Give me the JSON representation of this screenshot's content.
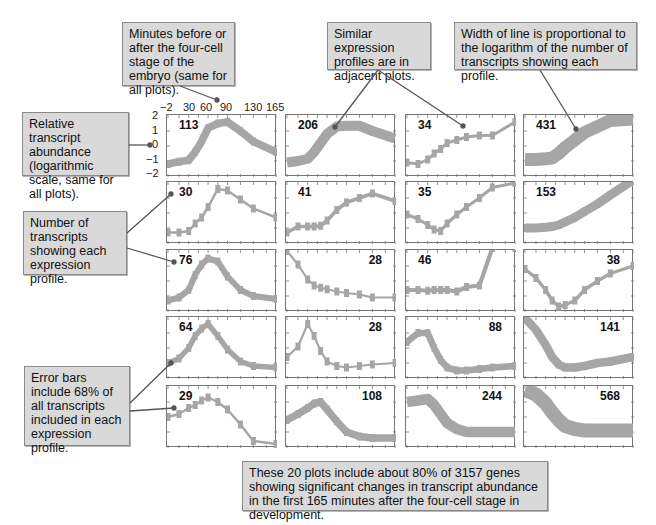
{
  "callouts": {
    "time_axis": "Minutes before or after the four-cell stage of the embryo (same for all plots).",
    "adjacent": "Similar expression profiles are in adjacent plots.",
    "line_width": "Width of line is proportional to the logarithm of the number of transcripts showing each profile.",
    "y_axis": "Relative transcript abundance (logarithmic scale, same for all plots).",
    "count": "Number of transcripts showing each expression profile.",
    "error_bars": "Error bars include 68% of all transcripts included in each expression profile.",
    "summary": "These 20 plots include about 80% of 3157 genes showing significant changes in transcript abundance in the first 165 minutes after the four-cell stage in development."
  },
  "axes": {
    "x_ticks": [
      "−2",
      "30",
      "60",
      "90",
      "130",
      "165"
    ],
    "y_ticks": [
      "2",
      "1",
      "0",
      "−1",
      "−2"
    ]
  },
  "colors": {
    "line": "#a6a6a6",
    "callout_bg": "#d9d9d9",
    "leader": "#555555"
  },
  "chart_data": {
    "type": "line",
    "xlabel": "Minutes before or after the four-cell stage of the embryo",
    "ylabel": "Relative transcript abundance (logarithmic scale)",
    "x": [
      -2,
      15,
      30,
      40,
      50,
      60,
      75,
      90,
      110,
      130,
      165
    ],
    "x_tick_labels": [
      "-2",
      "30",
      "60",
      "90",
      "130",
      "165"
    ],
    "xlim": [
      -2,
      165
    ],
    "ylim": [
      -2,
      2
    ],
    "grid": false,
    "panels": [
      {
        "row": 1,
        "col": 1,
        "count": 113,
        "values": [
          -1.2,
          -1.05,
          -0.95,
          -0.4,
          0.3,
          1.2,
          1.5,
          1.6,
          1.0,
          0.3,
          -0.4
        ]
      },
      {
        "row": 1,
        "col": 2,
        "count": 206,
        "values": [
          -1.1,
          -1.0,
          -0.85,
          -0.4,
          0.2,
          0.8,
          1.3,
          1.35,
          1.35,
          1.0,
          0.5
        ]
      },
      {
        "row": 1,
        "col": 3,
        "count": 34,
        "values": [
          -1.1,
          -1.2,
          -0.9,
          -0.5,
          -0.2,
          0.2,
          0.4,
          0.6,
          0.7,
          0.7,
          1.6
        ]
      },
      {
        "row": 1,
        "col": 4,
        "count": 431,
        "values": [
          -0.9,
          -0.9,
          -0.85,
          -0.8,
          -0.5,
          -0.1,
          0.4,
          0.9,
          1.3,
          1.7,
          1.8
        ]
      },
      {
        "row": 2,
        "col": 1,
        "count": 30,
        "values": [
          -1.3,
          -1.3,
          -1.2,
          -0.7,
          -0.3,
          0.4,
          1.6,
          1.5,
          0.9,
          0.3,
          -0.3
        ]
      },
      {
        "row": 2,
        "col": 2,
        "count": 41,
        "values": [
          -1.3,
          -0.9,
          -0.9,
          -0.9,
          -0.85,
          -0.5,
          0.2,
          0.7,
          1.0,
          1.3,
          0.8
        ]
      },
      {
        "row": 2,
        "col": 3,
        "count": 35,
        "values": [
          -0.1,
          -0.4,
          -0.8,
          -1.1,
          -1.2,
          -0.7,
          -0.1,
          0.4,
          1.0,
          1.7,
          2.0
        ]
      },
      {
        "row": 2,
        "col": 4,
        "count": 153,
        "values": [
          -1.0,
          -1.0,
          -0.95,
          -0.9,
          -0.8,
          -0.6,
          -0.3,
          0.1,
          0.6,
          1.2,
          2.2
        ]
      },
      {
        "row": 3,
        "col": 1,
        "count": 76,
        "values": [
          -1.3,
          -1.1,
          -0.6,
          0.4,
          1.1,
          1.5,
          1.3,
          0.3,
          -0.6,
          -1.0,
          -1.2
        ]
      },
      {
        "row": 3,
        "col": 2,
        "count": 28,
        "values": [
          2.0,
          1.1,
          0.1,
          -0.3,
          -0.45,
          -0.55,
          -0.7,
          -0.8,
          -0.9,
          -1.1,
          -1.1
        ]
      },
      {
        "row": 3,
        "col": 3,
        "count": 46,
        "values": [
          -0.6,
          -0.6,
          -0.65,
          -0.6,
          -0.6,
          -0.6,
          -0.7,
          -0.4,
          -0.3,
          2.2,
          2.2
        ]
      },
      {
        "row": 3,
        "col": 4,
        "count": 38,
        "values": [
          0.8,
          0.2,
          -0.6,
          -1.3,
          -1.7,
          -1.6,
          -1.3,
          -0.6,
          0.0,
          0.5,
          1.0
        ]
      },
      {
        "row": 4,
        "col": 1,
        "count": 64,
        "values": [
          -1.0,
          -0.7,
          0.0,
          0.8,
          1.3,
          1.6,
          0.8,
          -0.1,
          -0.9,
          -1.2,
          -1.3
        ]
      },
      {
        "row": 4,
        "col": 2,
        "count": 28,
        "values": [
          -0.6,
          0.1,
          1.6,
          0.8,
          -0.2,
          -0.9,
          -1.2,
          -1.3,
          -1.2,
          -1.1,
          -1.0
        ]
      },
      {
        "row": 4,
        "col": 3,
        "count": 88,
        "values": [
          0.4,
          1.0,
          1.0,
          0.0,
          -0.8,
          -1.3,
          -1.5,
          -1.5,
          -1.4,
          -1.3,
          -1.2
        ]
      },
      {
        "row": 4,
        "col": 4,
        "count": 141,
        "values": [
          2.0,
          1.2,
          0.2,
          -0.6,
          -1.1,
          -1.3,
          -1.3,
          -1.2,
          -1.0,
          -0.9,
          -0.6
        ]
      },
      {
        "row": 5,
        "col": 1,
        "count": 29,
        "values": [
          0.0,
          0.2,
          0.6,
          0.8,
          1.1,
          1.3,
          1.0,
          0.5,
          -0.5,
          -1.6,
          -1.8
        ]
      },
      {
        "row": 5,
        "col": 2,
        "count": 108,
        "values": [
          -0.2,
          0.2,
          0.6,
          0.9,
          1.0,
          0.5,
          -0.3,
          -1.0,
          -1.3,
          -1.4,
          -1.4
        ]
      },
      {
        "row": 5,
        "col": 3,
        "count": 244,
        "values": [
          1.0,
          1.1,
          1.2,
          0.8,
          0.2,
          -0.4,
          -0.8,
          -1.0,
          -1.0,
          -1.0,
          -1.0
        ]
      },
      {
        "row": 5,
        "col": 4,
        "count": 568,
        "values": [
          1.8,
          1.5,
          0.9,
          0.3,
          -0.2,
          -0.6,
          -0.8,
          -0.9,
          -0.9,
          -0.9,
          -0.9
        ]
      }
    ]
  }
}
